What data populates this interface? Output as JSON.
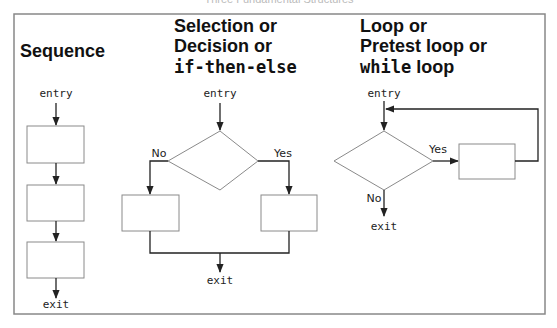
{
  "figure": {
    "caption": "Three Fundamental Structures",
    "colors": {
      "frame": "#888888",
      "box": "#8a8a8a",
      "line": "#222222",
      "text": "#111111"
    }
  },
  "sequence": {
    "title": "Sequence",
    "entry_label": "entry",
    "exit_label": "exit",
    "boxes": 3
  },
  "selection": {
    "title_line1": "Selection or",
    "title_line2": "Decision or",
    "title_line3": "if-then-else",
    "entry_label": "entry",
    "no_label": "No",
    "yes_label": "Yes",
    "exit_label": "exit"
  },
  "loop": {
    "title_line1": "Loop or",
    "title_line2": "Pretest loop or",
    "title_line3_mono": "while",
    "title_line3_rest": " loop",
    "entry_label": "entry",
    "yes_label": "Yes",
    "no_label": "No",
    "exit_label": "exit"
  }
}
